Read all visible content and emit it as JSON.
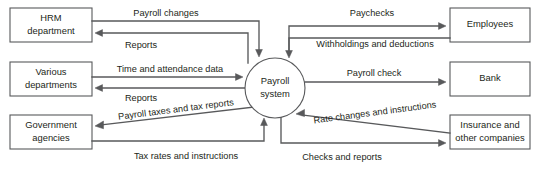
{
  "diagram": {
    "type": "data-flow-diagram",
    "colors": {
      "stroke": "#58595b",
      "text": "#231f20",
      "background": "#ffffff"
    },
    "process": {
      "name": "payroll-system",
      "line1": "Payroll",
      "line2": "system",
      "cx": 275,
      "cy": 88,
      "r": 30
    },
    "entities": [
      {
        "name": "hrm-department",
        "line1": "HRM",
        "line2": "department",
        "x": 10,
        "y": 8,
        "w": 82,
        "h": 34,
        "side": "left"
      },
      {
        "name": "various-departments",
        "line1": "Various",
        "line2": "departments",
        "x": 10,
        "y": 62,
        "w": 82,
        "h": 34,
        "side": "left"
      },
      {
        "name": "government-agencies",
        "line1": "Government",
        "line2": "agencies",
        "x": 10,
        "y": 115,
        "w": 82,
        "h": 34,
        "side": "left"
      },
      {
        "name": "employees",
        "line1": "Employees",
        "line2": "",
        "x": 450,
        "y": 8,
        "w": 80,
        "h": 34,
        "side": "right"
      },
      {
        "name": "bank",
        "line1": "Bank",
        "line2": "",
        "x": 450,
        "y": 62,
        "w": 80,
        "h": 34,
        "side": "right"
      },
      {
        "name": "insurance-and-other-companies",
        "line1": "Insurance and",
        "line2": "other companies",
        "x": 450,
        "y": 115,
        "w": 80,
        "h": 34,
        "side": "right"
      }
    ],
    "flows": [
      {
        "name": "flow-payroll-changes",
        "label": "Payroll changes",
        "from": "hrm-department",
        "to": "payroll-system",
        "label_x": 166,
        "label_y": 14,
        "rotate": 0,
        "path": "M 92 21 L 259 21 L 259 53",
        "arrow": "down",
        "ax": 259,
        "ay": 57
      },
      {
        "name": "flow-reports-hrm",
        "label": "Reports",
        "from": "payroll-system",
        "to": "hrm-department",
        "label_x": 141,
        "label_y": 46,
        "rotate": 0,
        "path": "M 248 63 L 248 33 L 100 33",
        "arrow": "left",
        "ax": 95,
        "ay": 33
      },
      {
        "name": "flow-time-and-attendance-data",
        "label": "Time and attendance data",
        "from": "various-departments",
        "to": "payroll-system",
        "label_x": 170,
        "label_y": 70,
        "rotate": 0,
        "path": "M 92 77 L 238 77",
        "arrow": "right",
        "ax": 243,
        "ay": 77
      },
      {
        "name": "flow-reports-departments",
        "label": "Reports",
        "from": "payroll-system",
        "to": "various-departments",
        "label_x": 141,
        "label_y": 99,
        "rotate": 0,
        "path": "M 245 88 L 100 88",
        "arrow": "left",
        "ax": 95,
        "ay": 88
      },
      {
        "name": "flow-payroll-taxes-and-tax-reports",
        "label": "Payroll taxes and tax reports",
        "from": "payroll-system",
        "to": "government-agencies",
        "label_x": 176,
        "label_y": 110,
        "rotate": -7.2,
        "path": "M 254 107 L 100 125",
        "arrow": "left-diag",
        "ax": 95,
        "ay": 126
      },
      {
        "name": "flow-tax-rates-and-instructions",
        "label": "Tax rates and instructions",
        "from": "government-agencies",
        "to": "payroll-system",
        "label_x": 186,
        "label_y": 157,
        "rotate": 0,
        "path": "M 92 141 L 264 141 L 264 123",
        "arrow": "up",
        "ax": 264,
        "ay": 118
      },
      {
        "name": "flow-paychecks",
        "label": "Paychecks",
        "from": "payroll-system",
        "to": "employees",
        "label_x": 372,
        "label_y": 14,
        "rotate": 0,
        "path": "M 289 53 L 289 26 L 440 26",
        "arrow": "right",
        "ax": 446,
        "ay": 26
      },
      {
        "name": "flow-withholdings-and-deductions",
        "label": "Withholdings and deductions",
        "from": "employees",
        "to": "payroll-system",
        "label_x": 375,
        "label_y": 45,
        "rotate": 0,
        "path": "M 450 38 L 289 38 L 289 53",
        "arrow": "down",
        "ax": 289,
        "ay": 58
      },
      {
        "name": "flow-payroll-check",
        "label": "Payroll check",
        "from": "payroll-system",
        "to": "bank",
        "label_x": 374,
        "label_y": 74,
        "rotate": 0,
        "path": "M 305 82 L 440 82",
        "arrow": "right",
        "ax": 446,
        "ay": 82
      },
      {
        "name": "flow-rate-changes-and-instructions",
        "label": "Rate changes and instructions",
        "from": "insurance-and-other-companies",
        "to": "payroll-system",
        "label_x": 375,
        "label_y": 113,
        "rotate": -7.5,
        "path": "M 450 133 L 302 115",
        "arrow": "left-diag2",
        "ax": 296,
        "ay": 114
      },
      {
        "name": "flow-checks-and-reports",
        "label": "Checks and reports",
        "from": "payroll-system",
        "to": "insurance-and-other-companies",
        "label_x": 342,
        "label_y": 158,
        "rotate": 0,
        "path": "M 281 114 L 281 143 L 440 143",
        "arrow": "right",
        "ax": 446,
        "ay": 143
      }
    ]
  }
}
